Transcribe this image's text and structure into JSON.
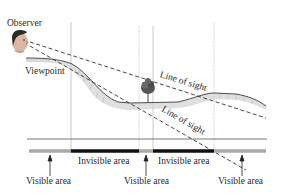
{
  "labels": {
    "observer": "Observer",
    "viewpoint": "Viewpoint",
    "line_of_sight_upper": "Line of sight",
    "line_of_sight_lower": "Line of sight",
    "invisible_area_1": "Invisible area",
    "invisible_area_2": "Invisible area",
    "visible_area_1": "Visible area",
    "visible_area_2": "Visible area",
    "visible_area_3": "Visible area"
  },
  "icons": {
    "observer": "human-head-icon",
    "tree": "tree-icon"
  },
  "colors": {
    "visible": "#a8a8a8",
    "invisible": "#111111",
    "terrain_line": "#333333",
    "terrain_shade": "#cfcfcf",
    "sight_line": "#333333",
    "guide_line": "#b8b8b8"
  }
}
